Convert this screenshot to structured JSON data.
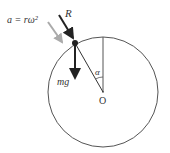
{
  "diagram": {
    "type": "free-body diagram on circle",
    "labels": {
      "acceleration": "a = rω²",
      "reaction": "R",
      "weight": "mg",
      "angle": "α",
      "center": "O"
    },
    "colors": {
      "circle": "#555555",
      "dark_arrow": "#222222",
      "grey_arrow": "#aaaaaa",
      "text": "#333333"
    }
  }
}
